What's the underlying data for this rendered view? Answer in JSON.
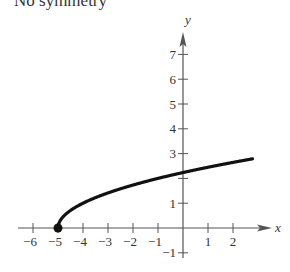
{
  "caption": "No symmetry",
  "chart_data": {
    "type": "line",
    "title": "No symmetry",
    "xlabel": "x",
    "ylabel": "y",
    "xlim": [
      -6.5,
      3.5
    ],
    "ylim": [
      -1.5,
      7.8
    ],
    "x_ticks": [
      -6,
      -5,
      -4,
      -3,
      -2,
      -1,
      1,
      2
    ],
    "y_ticks": [
      -1,
      1,
      3,
      4,
      5,
      6,
      7
    ],
    "x_tick_labels": [
      "−6",
      "−5",
      "−4",
      "−3",
      "−2",
      "−1",
      "1",
      "2"
    ],
    "y_tick_labels": [
      "−1",
      "1",
      "3",
      "4",
      "5",
      "6",
      "7"
    ],
    "grid": false,
    "series": [
      {
        "name": "y = sqrt(x + 5)",
        "function": "sqrt(x+5)",
        "x": [
          -5,
          -4.75,
          -4.5,
          -4,
          -3,
          -2,
          -1,
          0,
          1,
          2,
          2.7
        ],
        "y": [
          0,
          0.5,
          0.71,
          1,
          1.41,
          1.73,
          2,
          2.24,
          2.45,
          2.65,
          2.77
        ],
        "color": "#111111",
        "start_point": {
          "x": -5,
          "y": 0,
          "marker": "filled-circle"
        }
      }
    ]
  }
}
